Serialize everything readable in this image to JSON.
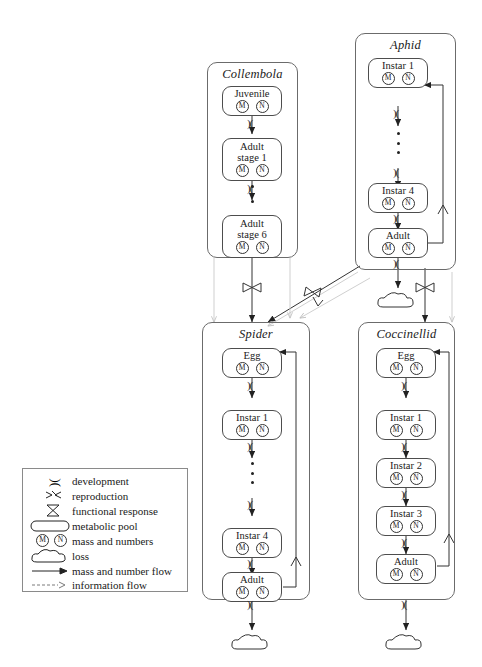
{
  "diagram": {
    "compartments": [
      {
        "id": "collembola",
        "name": "Collembola",
        "stages": [
          {
            "label": "Juvenile",
            "mass": "M",
            "numbers": "N"
          },
          {
            "label": "Adult\nstage 1",
            "mass": "M",
            "numbers": "N"
          },
          {
            "label": "Adult\nstage 6",
            "mass": "M",
            "numbers": "N"
          }
        ]
      },
      {
        "id": "aphid",
        "name": "Aphid",
        "stages": [
          {
            "label": "Instar 1",
            "mass": "M",
            "numbers": "N"
          },
          {
            "label": "Instar 4",
            "mass": "M",
            "numbers": "N"
          },
          {
            "label": "Adult",
            "mass": "M",
            "numbers": "N"
          }
        ]
      },
      {
        "id": "spider",
        "name": "Spider",
        "stages": [
          {
            "label": "Egg",
            "mass": "M",
            "numbers": "N"
          },
          {
            "label": "Instar 1",
            "mass": "M",
            "numbers": "N"
          },
          {
            "label": "Instar 4",
            "mass": "M",
            "numbers": "N"
          },
          {
            "label": "Adult",
            "mass": "M",
            "numbers": "N"
          }
        ]
      },
      {
        "id": "coccinellid",
        "name": "Coccinellid",
        "stages": [
          {
            "label": "Egg",
            "mass": "M",
            "numbers": "N"
          },
          {
            "label": "Instar 1",
            "mass": "M",
            "numbers": "N"
          },
          {
            "label": "Instar 2",
            "mass": "M",
            "numbers": "N"
          },
          {
            "label": "Instar 3",
            "mass": "M",
            "numbers": "N"
          },
          {
            "label": "Adult",
            "mass": "M",
            "numbers": "N"
          }
        ]
      }
    ]
  },
  "legend": {
    "items": [
      {
        "symbol": "development-valve-icon",
        "label": "development"
      },
      {
        "symbol": "reproduction-icon",
        "label": "reproduction"
      },
      {
        "symbol": "functional-response-icon",
        "label": "functional response"
      },
      {
        "symbol": "metabolic-pool-icon",
        "label": "metabolic pool"
      },
      {
        "symbol": "mass-numbers-icon",
        "label": "mass and numbers"
      },
      {
        "symbol": "loss-cloud-icon",
        "label": "loss"
      },
      {
        "symbol": "mass-number-flow-icon",
        "label": "mass and number flow"
      },
      {
        "symbol": "information-flow-icon",
        "label": "information flow"
      }
    ]
  },
  "symbols": {
    "development": ")(",
    "mass_letter": "M",
    "numbers_letter": "N"
  },
  "colors": {
    "stroke": "#4d4d4d",
    "compartment_stroke": "#6b6b6b",
    "info_flow": "#c9c9c9",
    "background": "#ffffff"
  }
}
